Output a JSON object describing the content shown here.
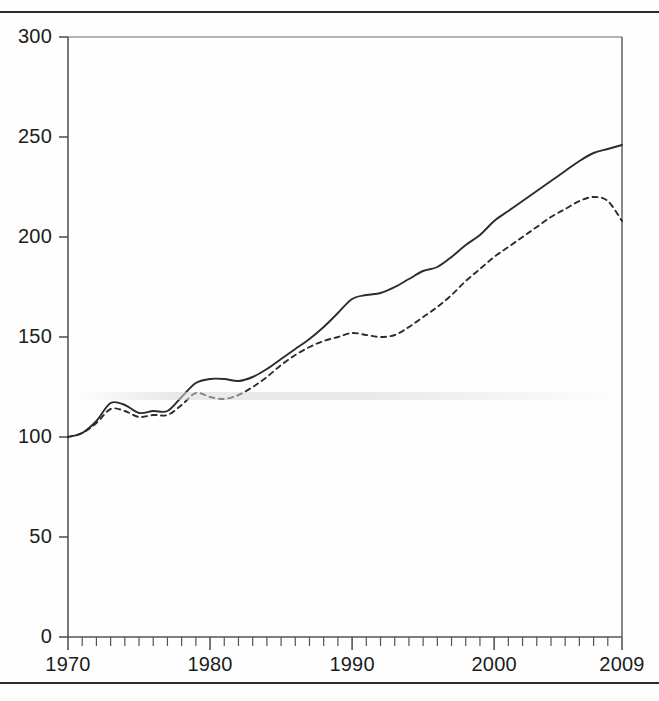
{
  "figure": {
    "top_rule": "",
    "bottom_rule": "",
    "caption_sliver": "",
    "line_color": "#2c2c2c",
    "axis_color": "#555555",
    "background": "#fefefe"
  },
  "chart_data": {
    "type": "line",
    "title": "",
    "subtitle": "",
    "xlabel": "",
    "ylabel": "",
    "xlim": [
      1970,
      2009
    ],
    "ylim": [
      0,
      300
    ],
    "grid": false,
    "legend": "none",
    "y_ticks": [
      0,
      50,
      100,
      150,
      200,
      250,
      300
    ],
    "y_tick_labels": [
      "0",
      "50",
      "100",
      "150",
      "200",
      "250",
      "300"
    ],
    "x_ticks": [
      1970,
      1980,
      1990,
      2000,
      2009
    ],
    "x_tick_labels": [
      "1970",
      "1980",
      "1990",
      "2000",
      "2009"
    ],
    "x_minor_tick_interval": 1,
    "x": [
      1970,
      1971,
      1972,
      1973,
      1974,
      1975,
      1976,
      1977,
      1978,
      1979,
      1980,
      1981,
      1982,
      1983,
      1984,
      1985,
      1986,
      1987,
      1988,
      1989,
      1990,
      1991,
      1992,
      1993,
      1994,
      1995,
      1996,
      1997,
      1998,
      1999,
      2000,
      2001,
      2002,
      2003,
      2004,
      2005,
      2006,
      2007,
      2008,
      2009
    ],
    "series": [
      {
        "name": "solid-series",
        "style": "solid",
        "color": "#2c2c2c",
        "values": [
          100,
          102,
          108,
          117,
          116,
          112,
          113,
          113,
          120,
          127,
          129,
          129,
          128,
          130,
          134,
          139,
          144,
          149,
          155,
          162,
          169,
          171,
          172,
          175,
          179,
          183,
          185,
          190,
          196,
          201,
          208,
          213,
          218,
          223,
          228,
          233,
          238,
          242,
          244,
          246
        ]
      },
      {
        "name": "dashed-series",
        "style": "dashed",
        "color": "#2c2c2c",
        "values": [
          100,
          102,
          107,
          114,
          113,
          110,
          111,
          111,
          116,
          122,
          120,
          119,
          121,
          125,
          130,
          136,
          141,
          145,
          148,
          150,
          152,
          151,
          150,
          151,
          155,
          160,
          165,
          171,
          178,
          184,
          190,
          195,
          200,
          205,
          210,
          214,
          218,
          220,
          218,
          208
        ]
      }
    ]
  }
}
